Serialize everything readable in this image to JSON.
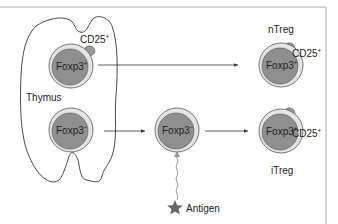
{
  "diagram": {
    "colors": {
      "cell_fill": "#8f8f8f",
      "cell_ring": "#e4e4e4",
      "cell_outline": "#555555",
      "receptor_fill": "#9a9a9a",
      "line": "#333333",
      "antigen_star": "#666666",
      "wavy_line": "#999999",
      "frame": "#9a9a9a"
    },
    "organ": {
      "label": "Thymus"
    },
    "cells": [
      {
        "id": "thymus-foxp3-pos",
        "label": "Foxp3",
        "sign": "+",
        "receptor": "CD25",
        "receptor_sign": "+",
        "has_receptor": true
      },
      {
        "id": "thymus-foxp3-neg",
        "label": "Foxp3",
        "sign": "−",
        "has_receptor": false
      },
      {
        "id": "periphery-foxp3-neg",
        "label": "Foxp3",
        "sign": "−",
        "has_receptor": false
      },
      {
        "id": "ntreg",
        "label": "Foxp3",
        "sign": "+",
        "receptor": "CD25",
        "receptor_sign": "+",
        "has_receptor": true,
        "name": "nTreg"
      },
      {
        "id": "itreg",
        "label": "Foxp3",
        "sign": "+",
        "receptor": "CD25",
        "receptor_sign": "+",
        "has_receptor": true,
        "name": "iTreg"
      }
    ],
    "antigen": {
      "label": "Antigen",
      "icon": "star-icon"
    },
    "arrows": [
      {
        "from": "thymus-foxp3-pos",
        "to": "ntreg"
      },
      {
        "from": "thymus-foxp3-neg",
        "to": "periphery-foxp3-neg"
      },
      {
        "from": "periphery-foxp3-neg",
        "to": "itreg"
      },
      {
        "from": "antigen",
        "to": "periphery-foxp3-neg",
        "style": "wavy"
      }
    ]
  }
}
